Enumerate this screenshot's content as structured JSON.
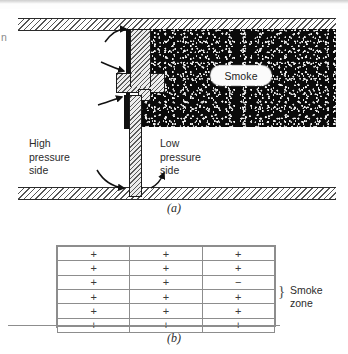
{
  "figure": {
    "panel_a": {
      "caption": "(a)",
      "labels": {
        "smoke": "Smoke",
        "high_pressure": "High\npressure\nside",
        "high_pressure_lines": [
          "High",
          "pressure",
          "side"
        ],
        "low_pressure": "Low\npressure\nside",
        "low_pressure_lines": [
          "Low",
          "pressure",
          "side"
        ]
      },
      "edge_fragment": "n",
      "icons": {
        "leakage_arrow_top": "curved-arrow-right-icon",
        "leakage_arrow_mid": "curved-arrow-right-icon",
        "swing_arrow_left": "curved-arrow-left-icon",
        "swing_arrow_right": "curved-arrow-right-icon"
      },
      "colors": {
        "smoke_fill": "#0a0a0a",
        "hatch_stroke": "#555555",
        "outline": "#1a1a1a",
        "door_fill": "#ededed",
        "jamb_fill": "#101010"
      }
    },
    "panel_b": {
      "caption": "(b)",
      "zone_label": "Smoke\nzone",
      "zone_label_lines": [
        "Smoke",
        "zone"
      ],
      "brace_glyph": "}",
      "grid": {
        "rows": 6,
        "columns": 3,
        "cells": [
          [
            "+",
            "+",
            "+"
          ],
          [
            "+",
            "+",
            "+"
          ],
          [
            "+",
            "+",
            "−"
          ],
          [
            "+",
            "+",
            "+"
          ],
          [
            "+",
            "+",
            "+"
          ],
          [
            "+",
            "+",
            "+"
          ]
        ]
      },
      "colors": {
        "grid_line": "#8d8d8d",
        "text": "#3a3a3a"
      }
    }
  }
}
